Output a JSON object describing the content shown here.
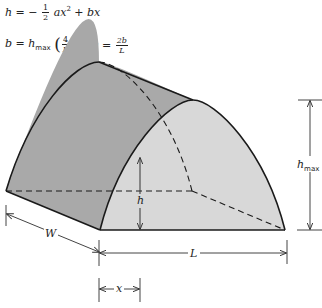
{
  "formulas": {
    "eq1": {
      "lhs": "h",
      "eq": "=",
      "sign": "−",
      "frac_num": "1",
      "frac_den": "2",
      "term1": "ax",
      "term1_exp": "2",
      "plus": "+",
      "term2": "bx"
    },
    "eq2": {
      "lhs": "b",
      "eq": "=",
      "h": "h",
      "h_sub": "max",
      "frac_num": "4",
      "frac_den": "L"
    },
    "eq3": {
      "lhs": "a",
      "eq": "=",
      "frac_num": "2b",
      "frac_den": "L"
    }
  },
  "labels": {
    "h": "h",
    "hmax_main": "h",
    "hmax_sub": "max",
    "W": "W",
    "L": "L",
    "x": "x"
  },
  "colors": {
    "side_face": "#a8a8a8",
    "front_face": "#d9d9d9",
    "line": "#1a1a1a",
    "dim_line": "#444444"
  }
}
